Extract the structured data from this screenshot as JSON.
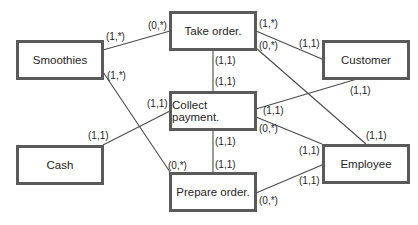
{
  "diagram": {
    "type": "entity-relationship",
    "entities": [
      {
        "id": "smoothies",
        "label": "Smoothies"
      },
      {
        "id": "take_order",
        "label": "Take order."
      },
      {
        "id": "customer",
        "label": "Customer"
      },
      {
        "id": "collect_payment",
        "label": "Collect payment."
      },
      {
        "id": "cash",
        "label": "Cash"
      },
      {
        "id": "employee",
        "label": "Employee"
      },
      {
        "id": "prepare_order",
        "label": "Prepare order."
      }
    ],
    "relationships": [
      {
        "from": "Smoothies",
        "to": "Take order.",
        "from_card": "(1,*)",
        "to_card": "(0,*)"
      },
      {
        "from": "Smoothies",
        "to": "Prepare order.",
        "from_card": "(1,*)",
        "to_card": "(0,*)"
      },
      {
        "from": "Take order.",
        "to": "Customer",
        "from_card": "(1,*)",
        "to_card": "(1,1)"
      },
      {
        "from": "Take order.",
        "to": "Employee",
        "from_card": "(0,*)",
        "to_card": "(1,1)"
      },
      {
        "from": "Take order.",
        "to": "Collect payment.",
        "from_card": "(1,1)",
        "to_card": "(1,1)"
      },
      {
        "from": "Collect payment.",
        "to": "Customer",
        "from_card": "(1,1)",
        "to_card": "(1,1)"
      },
      {
        "from": "Collect payment.",
        "to": "Cash",
        "from_card": "(1,1)",
        "to_card": "(1,1)"
      },
      {
        "from": "Collect payment.",
        "to": "Employee",
        "from_card": "(0,*)",
        "to_card": "(1,1)"
      },
      {
        "from": "Collect payment.",
        "to": "Prepare order.",
        "from_card": "(1,1)",
        "to_card": "(1,1)"
      },
      {
        "from": "Prepare order.",
        "to": "Employee",
        "from_card": "(0,*)",
        "to_card": "(1,1)"
      }
    ]
  },
  "labels": {
    "smoothies": "Smoothies",
    "take_order": "Take order.",
    "customer": "Customer",
    "collect_payment": "Collect payment.",
    "cash": "Cash",
    "employee": "Employee",
    "prepare_order": "Prepare order."
  },
  "cards": {
    "smoothies_take": "(1,*)",
    "take_smoothies": "(0,*)",
    "smoothies_prepare": "(1,*)",
    "prepare_smoothies": "(0,*)",
    "take_customer": "(1,*)",
    "customer_take": "(1,1)",
    "take_employee": "(0,*)",
    "employee_take": "(1,1)",
    "take_collect": "(1,1)",
    "collect_take": "(1,1)",
    "customer_collect": "(1,1)",
    "collect_customer": "(1,1)",
    "cash_collect": "(1,1)",
    "collect_cash": "(1,1)",
    "collect_employee": "(0,*)",
    "employee_collect": "(1,1)",
    "collect_prepare": "(1,1)",
    "prepare_collect": "(1,1)",
    "prepare_employee": "(0,*)",
    "employee_prepare": "(1,1)"
  }
}
